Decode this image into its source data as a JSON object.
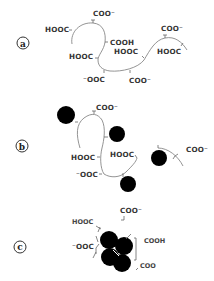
{
  "diagram": {
    "panels": [
      {
        "id": "a",
        "label": "a",
        "labels": [
          "COO⁻",
          "HOOC",
          "COOH",
          "HOOC",
          "HOOC",
          "⁻OOC",
          "COO⁻",
          "COO⁻",
          "HOOC"
        ]
      },
      {
        "id": "b",
        "label": "b",
        "labels": [
          "COO⁻",
          "HOOC",
          "HOOC",
          "⁻OOC",
          "COO⁻"
        ],
        "bound_particles": 5
      },
      {
        "id": "c",
        "label": "c",
        "labels": [
          "HOOC",
          "COO⁻",
          "⁻OOC",
          "COOH",
          "COO"
        ],
        "aggregated_particles": 4
      }
    ]
  }
}
